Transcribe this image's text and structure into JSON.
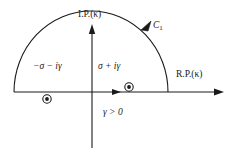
{
  "figure": {
    "type": "contour-integration-diagram",
    "background_color": "#ffffff",
    "stroke_color": "#1a1a1a",
    "axes": {
      "imaginary_axis_label": "I.P.(κ)",
      "real_axis_label": "R.P.(κ)"
    },
    "contour": {
      "label": "C",
      "label_subscript": "1",
      "shape": "upper-half-plane semicircle",
      "orientation": "counterclockwise"
    },
    "poles": [
      {
        "label_text": "−σ − iγ",
        "marker": "circled-dot",
        "location": "below real axis, left half"
      },
      {
        "label_text": "σ + iγ",
        "marker": "circled-dot",
        "location": "on real axis, right of origin"
      }
    ],
    "condition": "γ > 0"
  }
}
